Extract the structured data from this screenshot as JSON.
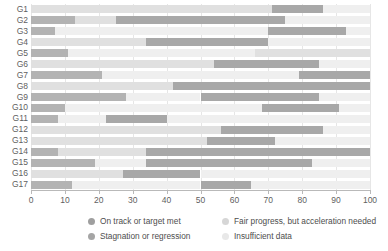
{
  "chart_data": {
    "type": "bar",
    "orientation": "horizontal",
    "stacked": true,
    "title": "",
    "xlabel": "",
    "ylabel": "",
    "xlim": [
      0,
      100
    ],
    "grid": true,
    "legend_position": "bottom",
    "categories": [
      "G1",
      "G2",
      "G3",
      "G4",
      "G5",
      "G6",
      "G7",
      "G8",
      "G9",
      "G10",
      "G11",
      "G12",
      "G13",
      "G14",
      "G15",
      "G16",
      "G17"
    ],
    "xticks": [
      0,
      10,
      20,
      30,
      40,
      50,
      60,
      70,
      80,
      90,
      100
    ],
    "series": [
      {
        "name": "On track or target met",
        "color": "#b3b3b3",
        "values": [
          0,
          13,
          7,
          0,
          11,
          0,
          21,
          0,
          28,
          10,
          8,
          0,
          0,
          8,
          19,
          0,
          12
        ]
      },
      {
        "name": "Fair progress, but acceleration needed",
        "color": "#e0e0e0",
        "values": [
          71,
          12,
          0,
          34,
          0,
          62,
          0,
          45,
          0,
          0,
          0,
          34,
          43,
          0,
          0,
          29,
          0
        ]
      },
      {
        "name": "Stagnation or regression",
        "color": "#a8a8a8",
        "values": [
          15,
          50,
          0,
          36,
          0,
          23,
          0,
          55,
          0,
          0,
          0,
          0,
          0,
          0,
          0,
          0,
          0
        ]
      },
      {
        "name": "Insufficient data",
        "color": "#efefef",
        "values": [
          14,
          25,
          93,
          30,
          89,
          15,
          79,
          0,
          72,
          90,
          92,
          66,
          57,
          92,
          81,
          71,
          88
        ]
      }
    ],
    "segments": [
      {
        "category": "G1",
        "parts": [
          {
            "series": "Fair progress, but acceleration needed",
            "start": 0,
            "end": 71
          },
          {
            "series": "Stagnation or regression",
            "start": 71,
            "end": 86
          },
          {
            "series": "Insufficient data",
            "start": 86,
            "end": 100
          }
        ]
      },
      {
        "category": "G2",
        "parts": [
          {
            "series": "On track or target met",
            "start": 0,
            "end": 13
          },
          {
            "series": "Fair progress, but acceleration needed",
            "start": 13,
            "end": 25
          },
          {
            "series": "Stagnation or regression",
            "start": 25,
            "end": 75
          },
          {
            "series": "Insufficient data",
            "start": 75,
            "end": 100
          }
        ]
      },
      {
        "category": "G3",
        "parts": [
          {
            "series": "On track or target met",
            "start": 0,
            "end": 7
          },
          {
            "series": "Insufficient data",
            "start": 7,
            "end": 70
          },
          {
            "series": "Stagnation or regression",
            "start": 70,
            "end": 93
          },
          {
            "series": "Insufficient data",
            "start": 93,
            "end": 100
          }
        ]
      },
      {
        "category": "G4",
        "parts": [
          {
            "series": "Fair progress, but acceleration needed",
            "start": 0,
            "end": 34
          },
          {
            "series": "Stagnation or regression",
            "start": 34,
            "end": 70
          },
          {
            "series": "Insufficient data",
            "start": 70,
            "end": 100
          }
        ]
      },
      {
        "category": "G5",
        "parts": [
          {
            "series": "On track or target met",
            "start": 0,
            "end": 11
          },
          {
            "series": "Insufficient data",
            "start": 11,
            "end": 66
          },
          {
            "series": "Fair progress, but acceleration needed",
            "start": 66,
            "end": 100
          }
        ]
      },
      {
        "category": "G6",
        "parts": [
          {
            "series": "Fair progress, but acceleration needed",
            "start": 0,
            "end": 54
          },
          {
            "series": "Stagnation or regression",
            "start": 54,
            "end": 85
          },
          {
            "series": "Insufficient data",
            "start": 85,
            "end": 100
          }
        ]
      },
      {
        "category": "G7",
        "parts": [
          {
            "series": "On track or target met",
            "start": 0,
            "end": 21
          },
          {
            "series": "Insufficient data",
            "start": 21,
            "end": 79
          },
          {
            "series": "Stagnation or regression",
            "start": 79,
            "end": 100
          }
        ]
      },
      {
        "category": "G8",
        "parts": [
          {
            "series": "Fair progress, but acceleration needed",
            "start": 0,
            "end": 42
          },
          {
            "series": "Stagnation or regression",
            "start": 42,
            "end": 100
          }
        ]
      },
      {
        "category": "G9",
        "parts": [
          {
            "series": "On track or target met",
            "start": 0,
            "end": 28
          },
          {
            "series": "Insufficient data",
            "start": 28,
            "end": 50
          },
          {
            "series": "Stagnation or regression",
            "start": 50,
            "end": 85
          },
          {
            "series": "Insufficient data",
            "start": 85,
            "end": 100
          }
        ]
      },
      {
        "category": "G10",
        "parts": [
          {
            "series": "On track or target met",
            "start": 0,
            "end": 10
          },
          {
            "series": "Insufficient data",
            "start": 10,
            "end": 68
          },
          {
            "series": "Stagnation or regression",
            "start": 68,
            "end": 91
          },
          {
            "series": "Insufficient data",
            "start": 91,
            "end": 100
          }
        ]
      },
      {
        "category": "G11",
        "parts": [
          {
            "series": "On track or target met",
            "start": 0,
            "end": 8
          },
          {
            "series": "Insufficient data",
            "start": 8,
            "end": 22
          },
          {
            "series": "Stagnation or regression",
            "start": 22,
            "end": 40
          },
          {
            "series": "Insufficient data",
            "start": 40,
            "end": 100
          }
        ]
      },
      {
        "category": "G12",
        "parts": [
          {
            "series": "Fair progress, but acceleration needed",
            "start": 0,
            "end": 56
          },
          {
            "series": "Stagnation or regression",
            "start": 56,
            "end": 86
          },
          {
            "series": "Insufficient data",
            "start": 86,
            "end": 100
          }
        ]
      },
      {
        "category": "G13",
        "parts": [
          {
            "series": "Fair progress, but acceleration needed",
            "start": 0,
            "end": 52
          },
          {
            "series": "Stagnation or regression",
            "start": 52,
            "end": 72
          },
          {
            "series": "Insufficient data",
            "start": 72,
            "end": 100
          }
        ]
      },
      {
        "category": "G14",
        "parts": [
          {
            "series": "On track or target met",
            "start": 0,
            "end": 8
          },
          {
            "series": "Fair progress, but acceleration needed",
            "start": 8,
            "end": 34
          },
          {
            "series": "Stagnation or regression",
            "start": 34,
            "end": 100
          }
        ]
      },
      {
        "category": "G15",
        "parts": [
          {
            "series": "On track or target met",
            "start": 0,
            "end": 19
          },
          {
            "series": "Insufficient data",
            "start": 19,
            "end": 34
          },
          {
            "series": "Stagnation or regression",
            "start": 34,
            "end": 83
          },
          {
            "series": "Insufficient data",
            "start": 83,
            "end": 100
          }
        ]
      },
      {
        "category": "G16",
        "parts": [
          {
            "series": "Fair progress, but acceleration needed",
            "start": 0,
            "end": 27
          },
          {
            "series": "Stagnation or regression",
            "start": 27,
            "end": 50
          },
          {
            "series": "Insufficient data",
            "start": 50,
            "end": 100
          }
        ]
      },
      {
        "category": "G17",
        "parts": [
          {
            "series": "On track or target met",
            "start": 0,
            "end": 12
          },
          {
            "series": "Insufficient data",
            "start": 12,
            "end": 50
          },
          {
            "series": "Stagnation or regression",
            "start": 50,
            "end": 65
          },
          {
            "series": "Insufficient data",
            "start": 65,
            "end": 100
          }
        ]
      }
    ]
  },
  "legend": {
    "items": [
      {
        "label": "On track or target met",
        "color": "#9f9f9f"
      },
      {
        "label": "Fair progress, but acceleration needed",
        "color": "#d6d6d6"
      },
      {
        "label": "Stagnation or regression",
        "color": "#a5a5a5"
      },
      {
        "label": "Insufficient data",
        "color": "#e8e8e8"
      }
    ]
  },
  "colors": {
    "axis": "#b9b9b9",
    "grid": "#e6e6e6",
    "text": "#5f5f5f",
    "background": "#ffffff"
  }
}
